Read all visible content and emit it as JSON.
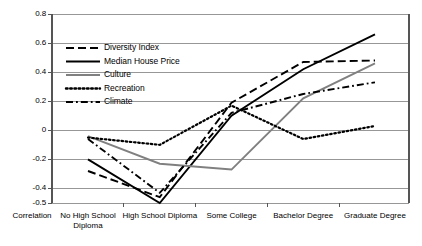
{
  "chart_data": {
    "type": "line",
    "title": "",
    "xlabel": "",
    "ylabel": "",
    "grid": true,
    "legend_position": "inside-upper-left",
    "ylim": [
      -0.5,
      0.8
    ],
    "yticks": [
      0.8,
      0.6,
      0.4,
      0.2,
      0,
      -0.2,
      -0.4,
      -0.5
    ],
    "ytick_labels": [
      "0.8",
      "0.6",
      "0.4",
      "0.2",
      "0",
      "-0.2",
      "-0.4",
      "-0.5"
    ],
    "axis_origin_label": "Correlation",
    "categories": [
      "No High School Diploma",
      "High School Diploma",
      "Some College",
      "Bachelor Degree",
      "Graduate Degree"
    ],
    "series": [
      {
        "name": "Diversity Index",
        "color": "#000000",
        "dash": "dashed",
        "values": [
          -0.28,
          -0.46,
          0.19,
          0.47,
          0.48
        ]
      },
      {
        "name": "Median House Price",
        "color": "#000000",
        "dash": "solid",
        "values": [
          -0.2,
          -0.5,
          0.1,
          0.42,
          0.66
        ]
      },
      {
        "name": "Culture",
        "color": "#808080",
        "dash": "solid",
        "values": [
          -0.04,
          -0.23,
          -0.27,
          0.22,
          0.46
        ]
      },
      {
        "name": "Recreation",
        "color": "#000000",
        "dash": "dotted",
        "values": [
          -0.05,
          -0.1,
          0.17,
          -0.06,
          0.03
        ]
      },
      {
        "name": "Climate",
        "color": "#000000",
        "dash": "dashdot",
        "values": [
          -0.06,
          -0.43,
          0.12,
          0.25,
          0.33
        ]
      }
    ]
  },
  "legend": {
    "items": [
      {
        "label": "Diversity Index"
      },
      {
        "label": "Median House Price"
      },
      {
        "label": "Culture"
      },
      {
        "label": "Recreation"
      },
      {
        "label": "Climate"
      }
    ]
  },
  "axes": {
    "y_labels": [
      "0.8",
      "0.6",
      "0.4",
      "0.2",
      "0",
      "-0.2",
      "-0.4",
      "-0.5"
    ],
    "x_labels": [
      "Correlation",
      "No High School Diploma",
      "High School Diploma",
      "Some College",
      "Bachelor Degree",
      "Graduate Degree"
    ]
  }
}
